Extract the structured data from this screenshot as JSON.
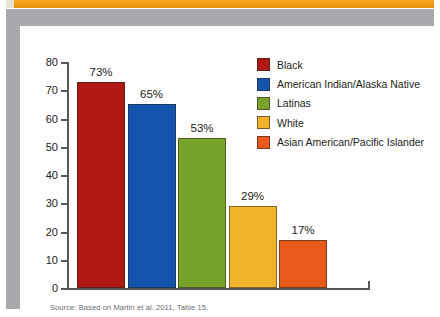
{
  "chart_data": {
    "type": "bar",
    "title": "",
    "xlabel": "",
    "ylabel": "",
    "ylim": [
      0,
      80
    ],
    "yticks": [
      0,
      10,
      20,
      30,
      40,
      50,
      60,
      70,
      80
    ],
    "grid": false,
    "legend_position": "top-right",
    "categories": [
      "Black",
      "American Indian/Alaska Native",
      "Latinas",
      "White",
      "Asian American/Pacific Islander"
    ],
    "values": [
      73,
      65,
      53,
      29,
      17
    ],
    "data_labels": [
      "73%",
      "65%",
      "53%",
      "29%",
      "17%"
    ],
    "colors": [
      "#b01813",
      "#1355ae",
      "#78a32a",
      "#f2b229",
      "#e8591b"
    ]
  },
  "legend": {
    "items": [
      {
        "label": "Black",
        "color": "#b01813"
      },
      {
        "label": "American Indian/Alaska Native",
        "color": "#1355ae"
      },
      {
        "label": "Latinas",
        "color": "#78a32a"
      },
      {
        "label": "White",
        "color": "#f2b229"
      },
      {
        "label": "Asian American/Pacific Islander",
        "color": "#e8591b"
      }
    ]
  },
  "axis": {
    "y_tick_labels": [
      "80",
      "70",
      "60",
      "50",
      "40",
      "30",
      "20",
      "10",
      "0"
    ]
  },
  "source": {
    "text": "Source: Based on Martin et al. 2011, Table 15."
  },
  "theme": {
    "banner_color": "#f09a12",
    "frame_color": "#a7a9ac",
    "panel_color": "#fdfdfd",
    "axis_color": "#58595b",
    "text_color": "#231f20"
  }
}
